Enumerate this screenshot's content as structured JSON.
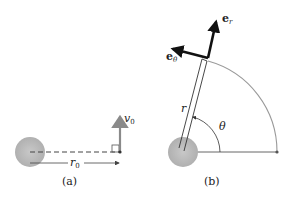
{
  "figure": {
    "panel_a": {
      "caption": "(a)",
      "velocity_label": "v",
      "velocity_sub": "0",
      "radius_label": "r",
      "radius_sub": "0"
    },
    "panel_b": {
      "caption": "(b)",
      "unit_radial_label": "e",
      "unit_radial_sub": "r",
      "unit_theta_label": "e",
      "unit_theta_sub": "θ",
      "radius_label": "r",
      "angle_label": "θ"
    },
    "colors": {
      "planet": "#bdbdbd",
      "velocity_arrow": "#8a8a8a",
      "unit_vectors": "#111111",
      "arc": "#9a9a9a",
      "lines": "#444444"
    }
  }
}
